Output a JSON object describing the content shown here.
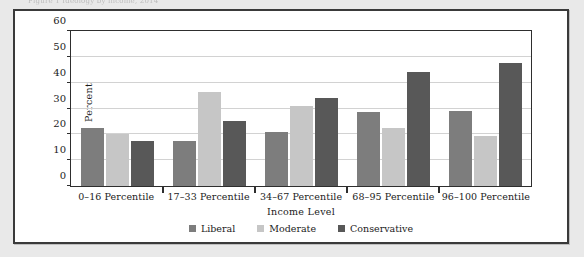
{
  "scan": {
    "caption_fragment": "Figure 1  Ideology by income, 2014"
  },
  "chart_data": {
    "type": "bar",
    "title": "",
    "subtitle": "",
    "xlabel": "Income Level",
    "ylabel": "Percent",
    "ylim": [
      0,
      60
    ],
    "yticks": [
      0,
      10,
      20,
      30,
      40,
      50,
      60
    ],
    "grid": true,
    "legend_position": "bottom",
    "categories": [
      "0–16 Percentile",
      "17–33 Percentile",
      "34–67 Percentile",
      "68–95 Percentile",
      "96–100 Percentile"
    ],
    "series": [
      {
        "name": "Liberal",
        "color": "#7d7d7d",
        "values": [
          22.5,
          17.5,
          21.0,
          28.5,
          29.0
        ]
      },
      {
        "name": "Moderate",
        "color": "#c6c6c6",
        "values": [
          20.0,
          36.5,
          31.0,
          22.5,
          19.5
        ]
      },
      {
        "name": "Conservative",
        "color": "#585858",
        "values": [
          17.5,
          25.0,
          34.0,
          44.0,
          47.5
        ]
      }
    ]
  },
  "colors": {
    "page_background": "#e9e9e9",
    "panel_background": "#ffffff",
    "panel_border": "#3a3a3a",
    "axis": "#2e2e2e",
    "gridline": "#d2d2d2",
    "text": "#1b1b1b"
  }
}
